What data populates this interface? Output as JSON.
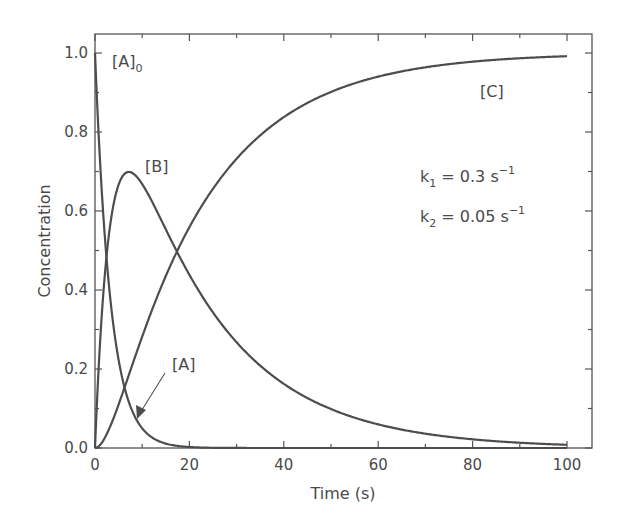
{
  "chart_data": {
    "type": "line",
    "title": "",
    "xlabel": "Time (s)",
    "ylabel": "Concentration",
    "xlim": [
      0,
      105
    ],
    "ylim": [
      0,
      1.05
    ],
    "xticks": [
      0,
      20,
      40,
      60,
      80,
      100
    ],
    "xtick_labels": [
      "0",
      "20",
      "40",
      "60",
      "80",
      "100"
    ],
    "yticks": [
      0.0,
      0.2,
      0.4,
      0.6,
      0.8,
      1.0
    ],
    "ytick_labels": [
      "0.0",
      "0.2",
      "0.4",
      "0.6",
      "0.8",
      "1.0"
    ],
    "grid": false,
    "legend": "none (inline labels)",
    "parameters": {
      "k1": 0.3,
      "k2": 0.05
    },
    "x": [
      0,
      2,
      4,
      6,
      8,
      10,
      15,
      20,
      30,
      40,
      50,
      60,
      70,
      80,
      90,
      100
    ],
    "series": [
      {
        "name": "[A]",
        "values": [
          1.0,
          0.549,
          0.301,
          0.165,
          0.091,
          0.05,
          0.011,
          0.002,
          0.0,
          0.0,
          0.0,
          0.0,
          0.0,
          0.0,
          0.0,
          0.0
        ]
      },
      {
        "name": "[B]",
        "values": [
          0.0,
          0.547,
          0.721,
          0.691,
          0.672,
          0.668,
          0.55,
          0.439,
          0.268,
          0.162,
          0.098,
          0.06,
          0.036,
          0.022,
          0.013,
          0.008
        ]
      },
      {
        "name": "[C]",
        "values": [
          0.0,
          0.004,
          0.02,
          0.122,
          0.237,
          0.282,
          0.439,
          0.559,
          0.732,
          0.838,
          0.902,
          0.94,
          0.964,
          0.978,
          0.987,
          0.992
        ]
      }
    ],
    "annotations": [
      {
        "text": "[A]0",
        "x": 2,
        "y": 1.0
      },
      {
        "text": "[B]",
        "x": 12,
        "y": 0.71
      },
      {
        "text": "[C]",
        "x": 76,
        "y": 0.91
      },
      {
        "text": "[A]",
        "x": 17,
        "y": 0.2,
        "arrow_to": [
          9,
          0.08
        ]
      },
      {
        "text": "k1 = 0.3 s^-1",
        "x": 60,
        "y": 0.72
      },
      {
        "text": "k2 = 0.05 s^-1",
        "x": 60,
        "y": 0.62
      }
    ]
  },
  "labels": {
    "xlabel": "Time (s)",
    "ylabel": "Concentration",
    "A0_main": "[A]",
    "A0_sub": "0",
    "B": "[B]",
    "C": "[C]",
    "A": "[A]",
    "k1_prefix": "k",
    "k1_sub": "1",
    "k1_eq": " = 0.3 s",
    "k1_sup": "−1",
    "k2_prefix": "k",
    "k2_sub": "2",
    "k2_eq": " = 0.05 s",
    "k2_sup": "−1"
  },
  "colors": {
    "line": "#4d4d4d",
    "text": "#4a4a4a",
    "background": "#ffffff"
  }
}
